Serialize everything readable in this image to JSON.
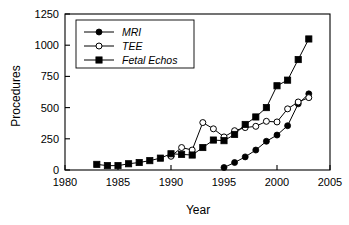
{
  "chart_data": {
    "type": "line",
    "title": "",
    "xlabel": "Year",
    "ylabel": "Procedures",
    "xlim": [
      1980,
      2005
    ],
    "ylim": [
      0,
      1250
    ],
    "xticks": [
      1980,
      1985,
      1990,
      1995,
      2000,
      2005
    ],
    "yticks": [
      0,
      250,
      500,
      750,
      1000,
      1250
    ],
    "grid": false,
    "legend_position": "top-left",
    "series": [
      {
        "name": "MRI",
        "marker": "filled-circle",
        "x": [
          1995,
          1996,
          1997,
          1998,
          1999,
          2000,
          2001,
          2002,
          2003
        ],
        "values": [
          20,
          60,
          105,
          160,
          230,
          280,
          355,
          530,
          610
        ]
      },
      {
        "name": "TEE",
        "marker": "open-circle",
        "x": [
          1990,
          1991,
          1992,
          1993,
          1994,
          1995,
          1996,
          1997,
          1998,
          1999,
          2000,
          2001,
          2002,
          2003
        ],
        "values": [
          110,
          180,
          160,
          380,
          330,
          265,
          315,
          340,
          350,
          390,
          385,
          490,
          545,
          580
        ]
      },
      {
        "name": "Fetal Echos",
        "marker": "filled-square",
        "x": [
          1983,
          1984,
          1985,
          1986,
          1987,
          1988,
          1989,
          1990,
          1991,
          1992,
          1993,
          1994,
          1995,
          1996,
          1997,
          1998,
          1999,
          2000,
          2001,
          2002,
          2003
        ],
        "values": [
          45,
          35,
          35,
          50,
          60,
          75,
          95,
          130,
          125,
          120,
          180,
          240,
          235,
          285,
          365,
          425,
          500,
          675,
          720,
          885,
          1050
        ]
      }
    ]
  },
  "legend": {
    "entries": [
      {
        "label": "MRI",
        "marker": "filled-circle"
      },
      {
        "label": "TEE",
        "marker": "open-circle"
      },
      {
        "label": "Fetal Echos",
        "marker": "filled-square"
      }
    ]
  },
  "colors": {
    "foreground": "#000000",
    "background": "#ffffff"
  }
}
